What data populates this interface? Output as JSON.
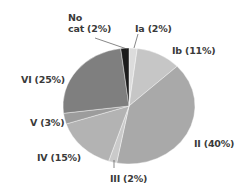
{
  "chart_data": {
    "type": "pie",
    "title": "",
    "start_angle_deg": 0,
    "direction": "clockwise",
    "categories": [
      "Ia",
      "Ib",
      "II",
      "III",
      "IV",
      "V",
      "VI",
      "No cat"
    ],
    "values": [
      2,
      11,
      40,
      2,
      15,
      3,
      25,
      2
    ],
    "unit": "%",
    "colors": [
      "#dcdcdc",
      "#c6c6c6",
      "#a9a9a9",
      "#cacaca",
      "#b3b3b3",
      "#9c9c9c",
      "#7f7f7f",
      "#1c1c1c"
    ],
    "labels": [
      "Ia (2%)",
      "Ib (11%)",
      "II (40%)",
      "III (2%)",
      "IV (15%)",
      "V (3%)",
      "VI (25%)",
      "No cat (2%)"
    ],
    "legend": "none"
  },
  "labels": {
    "ia": "Ia (2%)",
    "ib": "Ib (11%)",
    "ii": "II (40%)",
    "iii": "III (2%)",
    "iv": "IV (15%)",
    "v": "V (3%)",
    "vi": "VI (25%)",
    "nocat_line1": "No",
    "nocat_line2": "cat (2%)"
  }
}
